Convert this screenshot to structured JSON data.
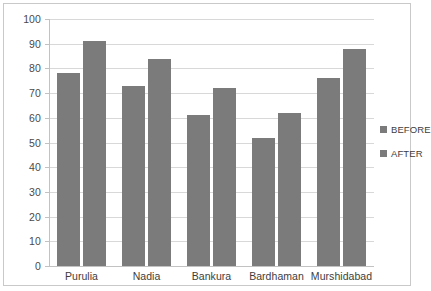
{
  "chart_data": {
    "type": "bar",
    "title": "",
    "subtitle": "",
    "xlabel": "",
    "ylabel": "",
    "categories": [
      "Purulia",
      "Nadia",
      "Bankura",
      "Bardhaman",
      "Murshidabad"
    ],
    "series": [
      {
        "name": "BEFORE",
        "values": [
          78,
          73,
          61,
          52,
          76
        ],
        "color": "#7b7b7b"
      },
      {
        "name": "AFTER",
        "values": [
          91,
          84,
          72,
          62,
          88
        ],
        "color": "#7b7b7b"
      }
    ],
    "ylim": [
      0,
      100
    ],
    "ytick_step": 10,
    "yticks": [
      "0",
      "10",
      "20",
      "30",
      "40",
      "50",
      "60",
      "70",
      "80",
      "90",
      "100"
    ],
    "grid": "horizontal",
    "legend_position": "right"
  },
  "legend": {
    "entries": [
      {
        "label": "BEFORE",
        "color": "#7b7b7b"
      },
      {
        "label": "AFTER",
        "color": "#7b7b7b"
      }
    ]
  },
  "style": {
    "bar_color": "#7b7b7b",
    "grid_color": "#d8d8d8",
    "axis_color": "#c2c2c2",
    "border_color": "#c9c9c9",
    "background": "#ffffff",
    "text_color": "#3d3d3d"
  }
}
